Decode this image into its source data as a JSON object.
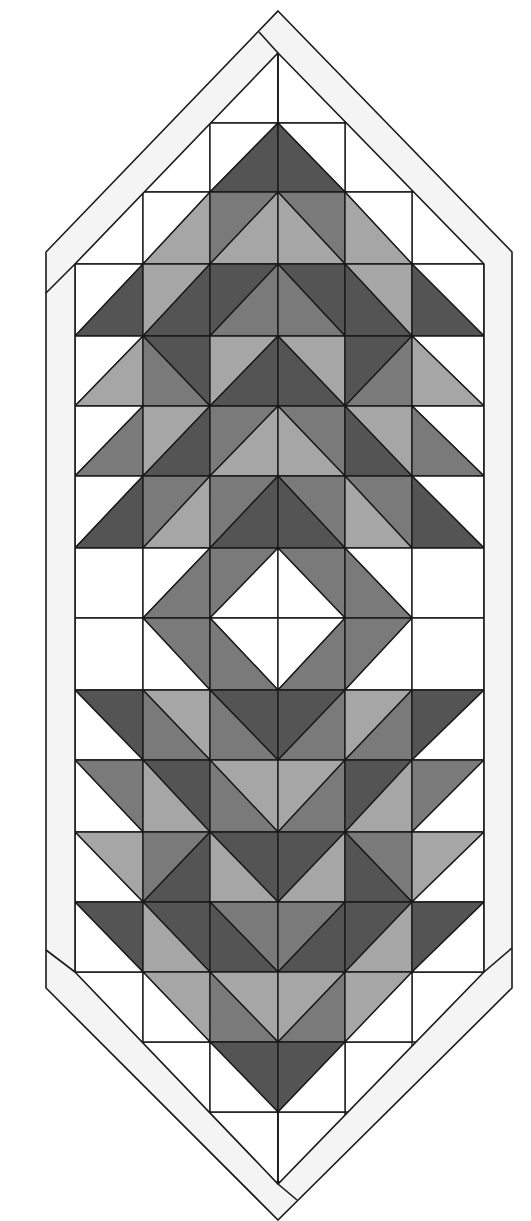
{
  "diagram": {
    "title": "",
    "type": "quilt table runner pattern",
    "palette": {
      "W": "#ffffff",
      "L": "#a6a6a6",
      "M": "#7a7a7a",
      "D": "#545454",
      "border": "#f4f4f4",
      "line": "#1a1a1a"
    },
    "grid": {
      "x_edges": [
        75,
        143,
        210,
        278,
        345,
        412,
        484
      ],
      "y_edges": [
        123,
        192,
        264,
        336,
        406,
        476,
        548,
        618,
        690,
        760,
        832,
        902,
        972,
        1042,
        1112
      ]
    },
    "inner_outline": [
      [
        278,
        53
      ],
      [
        484,
        264
      ],
      [
        484,
        972
      ],
      [
        278,
        1184
      ],
      [
        75,
        972
      ],
      [
        75,
        264
      ]
    ],
    "outer_outline": [
      [
        278,
        11
      ],
      [
        512,
        252
      ],
      [
        512,
        988
      ],
      [
        278,
        1220
      ],
      [
        46,
        988
      ],
      [
        46,
        252
      ]
    ],
    "border_seams": [
      [
        [
          259,
          32
        ],
        [
          278,
          53
        ]
      ],
      [
        [
          46,
          293
        ],
        [
          75,
          264
        ]
      ],
      [
        [
          512,
          948
        ],
        [
          484,
          972
        ]
      ],
      [
        [
          46,
          950
        ],
        [
          75,
          972
        ]
      ],
      [
        [
          297,
          1200
        ],
        [
          278,
          1184
        ]
      ]
    ],
    "center_lines": [
      [
        [
          278,
          53
        ],
        [
          278,
          123
        ]
      ],
      [
        [
          278,
          1112
        ],
        [
          278,
          1184
        ]
      ]
    ],
    "setting_cells": [
      {
        "row": -1,
        "col": 2
      },
      {
        "row": -1,
        "col": 3
      },
      {
        "row": 0,
        "col": 1
      },
      {
        "row": 0,
        "col": 4
      },
      {
        "row": 1,
        "col": 0
      },
      {
        "row": 1,
        "col": 5
      },
      {
        "row": 12,
        "col": 0
      },
      {
        "row": 12,
        "col": 5
      },
      {
        "row": 13,
        "col": 1
      },
      {
        "row": 13,
        "col": 4
      },
      {
        "row": 14,
        "col": 2
      },
      {
        "row": 14,
        "col": 3
      }
    ],
    "rows": [
      {
        "row": 0,
        "cells": [
          {
            "col": 2,
            "diag": "/",
            "a": "W",
            "b": "D"
          },
          {
            "col": 3,
            "diag": "\\",
            "a": "W",
            "b": "D"
          }
        ]
      },
      {
        "row": 1,
        "cells": [
          {
            "col": 1,
            "diag": "/",
            "a": "W",
            "b": "L"
          },
          {
            "col": 2,
            "diag": "/",
            "a": "M",
            "b": "L"
          },
          {
            "col": 3,
            "diag": "\\",
            "a": "M",
            "b": "L"
          },
          {
            "col": 4,
            "diag": "\\",
            "a": "W",
            "b": "L"
          }
        ]
      },
      {
        "row": 2,
        "cells": [
          {
            "col": 0,
            "diag": "/",
            "a": "W",
            "b": "D"
          },
          {
            "col": 1,
            "diag": "/",
            "a": "L",
            "b": "D"
          },
          {
            "col": 2,
            "diag": "/",
            "a": "D",
            "b": "M"
          },
          {
            "col": 3,
            "diag": "\\",
            "a": "D",
            "b": "M"
          },
          {
            "col": 4,
            "diag": "\\",
            "a": "L",
            "b": "D"
          },
          {
            "col": 5,
            "diag": "\\",
            "a": "W",
            "b": "D"
          }
        ]
      },
      {
        "row": 3,
        "cells": [
          {
            "col": 0,
            "diag": "/",
            "a": "W",
            "b": "L"
          },
          {
            "col": 1,
            "diag": "\\",
            "a": "D",
            "b": "M"
          },
          {
            "col": 2,
            "diag": "/",
            "a": "L",
            "b": "D"
          },
          {
            "col": 3,
            "diag": "\\",
            "a": "L",
            "b": "D"
          },
          {
            "col": 4,
            "diag": "/",
            "a": "D",
            "b": "M"
          },
          {
            "col": 5,
            "diag": "\\",
            "a": "W",
            "b": "L"
          }
        ]
      },
      {
        "row": 4,
        "cells": [
          {
            "col": 0,
            "diag": "/",
            "a": "W",
            "b": "M"
          },
          {
            "col": 1,
            "diag": "/",
            "a": "L",
            "b": "D"
          },
          {
            "col": 2,
            "diag": "/",
            "a": "M",
            "b": "L"
          },
          {
            "col": 3,
            "diag": "\\",
            "a": "M",
            "b": "L"
          },
          {
            "col": 4,
            "diag": "\\",
            "a": "L",
            "b": "D"
          },
          {
            "col": 5,
            "diag": "\\",
            "a": "W",
            "b": "M"
          }
        ]
      },
      {
        "row": 5,
        "cells": [
          {
            "col": 0,
            "diag": "/",
            "a": "W",
            "b": "D"
          },
          {
            "col": 1,
            "diag": "/",
            "a": "M",
            "b": "L"
          },
          {
            "col": 2,
            "diag": "/",
            "a": "M",
            "b": "D"
          },
          {
            "col": 3,
            "diag": "\\",
            "a": "M",
            "b": "D"
          },
          {
            "col": 4,
            "diag": "\\",
            "a": "M",
            "b": "L"
          },
          {
            "col": 5,
            "diag": "\\",
            "a": "W",
            "b": "D"
          }
        ]
      },
      {
        "row": 6,
        "cells": [
          {
            "col": 0,
            "diag": "none",
            "a": "W",
            "b": "W"
          },
          {
            "col": 1,
            "diag": "/",
            "a": "W",
            "b": "M"
          },
          {
            "col": 2,
            "diag": "/",
            "a": "M",
            "b": "W"
          },
          {
            "col": 3,
            "diag": "\\",
            "a": "M",
            "b": "W"
          },
          {
            "col": 4,
            "diag": "\\",
            "a": "W",
            "b": "M"
          },
          {
            "col": 5,
            "diag": "none",
            "a": "W",
            "b": "W"
          }
        ]
      },
      {
        "row": 7,
        "cells": [
          {
            "col": 0,
            "diag": "none",
            "a": "W",
            "b": "W"
          },
          {
            "col": 1,
            "diag": "\\",
            "a": "M",
            "b": "W"
          },
          {
            "col": 2,
            "diag": "\\",
            "a": "W",
            "b": "M"
          },
          {
            "col": 3,
            "diag": "/",
            "a": "W",
            "b": "M"
          },
          {
            "col": 4,
            "diag": "/",
            "a": "M",
            "b": "W"
          },
          {
            "col": 5,
            "diag": "none",
            "a": "W",
            "b": "W"
          }
        ]
      },
      {
        "row": 8,
        "cells": [
          {
            "col": 0,
            "diag": "\\",
            "a": "D",
            "b": "W"
          },
          {
            "col": 1,
            "diag": "\\",
            "a": "L",
            "b": "M"
          },
          {
            "col": 2,
            "diag": "\\",
            "a": "D",
            "b": "M"
          },
          {
            "col": 3,
            "diag": "/",
            "a": "D",
            "b": "M"
          },
          {
            "col": 4,
            "diag": "/",
            "a": "L",
            "b": "M"
          },
          {
            "col": 5,
            "diag": "/",
            "a": "D",
            "b": "W"
          }
        ]
      },
      {
        "row": 9,
        "cells": [
          {
            "col": 0,
            "diag": "\\",
            "a": "M",
            "b": "W"
          },
          {
            "col": 1,
            "diag": "\\",
            "a": "D",
            "b": "L"
          },
          {
            "col": 2,
            "diag": "\\",
            "a": "L",
            "b": "M"
          },
          {
            "col": 3,
            "diag": "/",
            "a": "L",
            "b": "M"
          },
          {
            "col": 4,
            "diag": "/",
            "a": "D",
            "b": "L"
          },
          {
            "col": 5,
            "diag": "/",
            "a": "M",
            "b": "W"
          }
        ]
      },
      {
        "row": 10,
        "cells": [
          {
            "col": 0,
            "diag": "\\",
            "a": "L",
            "b": "W"
          },
          {
            "col": 1,
            "diag": "/",
            "a": "M",
            "b": "D"
          },
          {
            "col": 2,
            "diag": "\\",
            "a": "D",
            "b": "L"
          },
          {
            "col": 3,
            "diag": "/",
            "a": "D",
            "b": "L"
          },
          {
            "col": 4,
            "diag": "\\",
            "a": "M",
            "b": "D"
          },
          {
            "col": 5,
            "diag": "/",
            "a": "L",
            "b": "W"
          }
        ]
      },
      {
        "row": 11,
        "cells": [
          {
            "col": 0,
            "diag": "\\",
            "a": "D",
            "b": "W"
          },
          {
            "col": 1,
            "diag": "\\",
            "a": "D",
            "b": "L"
          },
          {
            "col": 2,
            "diag": "\\",
            "a": "M",
            "b": "D"
          },
          {
            "col": 3,
            "diag": "/",
            "a": "M",
            "b": "D"
          },
          {
            "col": 4,
            "diag": "/",
            "a": "D",
            "b": "L"
          },
          {
            "col": 5,
            "diag": "/",
            "a": "D",
            "b": "W"
          }
        ]
      },
      {
        "row": 12,
        "cells": [
          {
            "col": 1,
            "diag": "\\",
            "a": "L",
            "b": "W"
          },
          {
            "col": 2,
            "diag": "\\",
            "a": "L",
            "b": "M"
          },
          {
            "col": 3,
            "diag": "/",
            "a": "L",
            "b": "M"
          },
          {
            "col": 4,
            "diag": "/",
            "a": "L",
            "b": "W"
          }
        ]
      },
      {
        "row": 13,
        "cells": [
          {
            "col": 2,
            "diag": "\\",
            "a": "D",
            "b": "W"
          },
          {
            "col": 3,
            "diag": "/",
            "a": "D",
            "b": "W"
          }
        ]
      }
    ]
  }
}
